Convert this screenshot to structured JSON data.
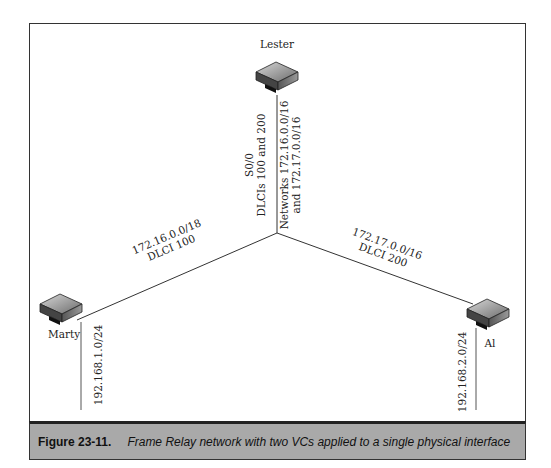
{
  "diagram": {
    "nodes": [
      {
        "id": "lester",
        "label": "Lester",
        "type": "router"
      },
      {
        "id": "marty",
        "label": "Marty",
        "type": "router"
      },
      {
        "id": "al",
        "label": "Al",
        "type": "router"
      }
    ],
    "lester_link": {
      "line1": "S0/0",
      "line2": "DLCIs 100 and 200",
      "line3": "Networks 172.16.0.0/16",
      "line4": "and 172.17.0.0/16"
    },
    "marty_link": {
      "line1": "172.16.0.0/18",
      "line2": "DLCI 100"
    },
    "al_link": {
      "line1": "172.17.0.0/16",
      "line2": "DLCI 200"
    },
    "marty_lan": "192.168.1.0/24",
    "al_lan": "192.168.2.0/24"
  },
  "caption": {
    "number": "Figure 23-11.",
    "text": "Frame Relay network with two VCs applied to a single physical interface"
  },
  "colors": {
    "caption_bg": "#a9a9a9",
    "line": "#333333"
  }
}
